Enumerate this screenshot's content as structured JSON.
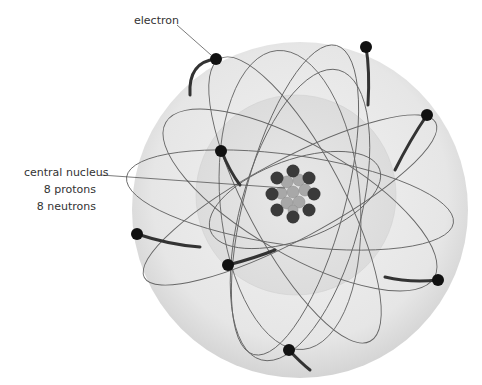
{
  "diagram": {
    "labels": {
      "electron": "electron",
      "nucleus_title": "central nucleus",
      "protons": "8 protons",
      "neutrons": "8 neutrons"
    },
    "counts": {
      "protons": 8,
      "neutrons": 8,
      "electrons": 8
    },
    "colors": {
      "sphere_fill": "#e8e8e8",
      "inner_sphere": "#dedede",
      "orbit": "#555555",
      "electron": "#111111",
      "proton": "#3a3a3a",
      "neutron": "#a8a8a8",
      "text": "#333333"
    }
  }
}
